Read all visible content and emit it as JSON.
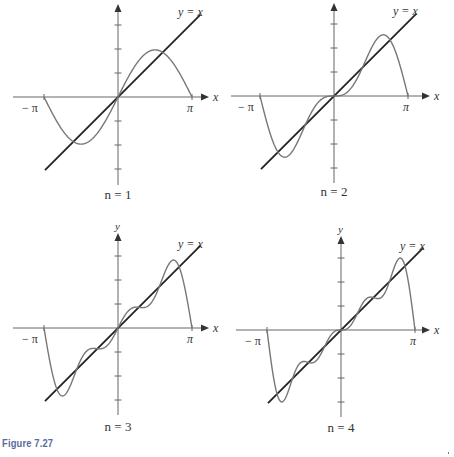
{
  "figure": {
    "caption": "Figure 7.27",
    "colors": {
      "axis": "#666666",
      "line": "#222222",
      "curve": "#777777",
      "text": "#333333"
    }
  },
  "chart_data": [
    {
      "type": "line",
      "title": "n = 1",
      "xlabel": "x",
      "ylabel": "y",
      "xlim": [
        -3.14159,
        3.14159
      ],
      "xticks": [
        "−π",
        "π"
      ],
      "yticks": [
        -3,
        -2,
        -1,
        1,
        2,
        3
      ],
      "series": [
        {
          "name": "y = x",
          "type": "function",
          "expr": "x",
          "x_range": [
            -3.14159,
            3.14159
          ]
        },
        {
          "name": "S_1(x) = 2 sin x",
          "type": "fourier_partial_sum",
          "n": 1,
          "x_range": [
            -3.14159,
            3.14159
          ]
        }
      ],
      "annotations": [
        "y = x"
      ]
    },
    {
      "type": "line",
      "title": "n = 2",
      "xlabel": "x",
      "ylabel": "y",
      "xlim": [
        -3.14159,
        3.14159
      ],
      "xticks": [
        "−π",
        "π"
      ],
      "yticks": [
        -3,
        -2,
        -1,
        1,
        2,
        3
      ],
      "series": [
        {
          "name": "y = x",
          "type": "function",
          "expr": "x",
          "x_range": [
            -3.14159,
            3.14159
          ]
        },
        {
          "name": "S_2(x) = 2 sin x − sin 2x",
          "type": "fourier_partial_sum",
          "n": 2,
          "x_range": [
            -3.14159,
            3.14159
          ]
        }
      ],
      "annotations": [
        "y = x"
      ]
    },
    {
      "type": "line",
      "title": "n = 3",
      "xlabel": "x",
      "ylabel": "y",
      "xlim": [
        -3.14159,
        3.14159
      ],
      "xticks": [
        "−π",
        "π"
      ],
      "yticks": [
        -3,
        -2,
        -1,
        1,
        2,
        3
      ],
      "series": [
        {
          "name": "y = x",
          "type": "function",
          "expr": "x",
          "x_range": [
            -3.14159,
            3.14159
          ]
        },
        {
          "name": "S_3(x) = 2 sin x − sin 2x + (2/3) sin 3x",
          "type": "fourier_partial_sum",
          "n": 3,
          "x_range": [
            -3.14159,
            3.14159
          ]
        }
      ],
      "annotations": [
        "y = x"
      ]
    },
    {
      "type": "line",
      "title": "n = 4",
      "xlabel": "x",
      "ylabel": "y",
      "xlim": [
        -3.14159,
        3.14159
      ],
      "xticks": [
        "−π",
        "π"
      ],
      "yticks": [
        -3,
        -2,
        -1,
        1,
        2,
        3
      ],
      "series": [
        {
          "name": "y = x",
          "type": "function",
          "expr": "x",
          "x_range": [
            -3.14159,
            3.14159
          ]
        },
        {
          "name": "S_4(x) = 2 sin x − sin 2x + (2/3) sin 3x − (1/2) sin 4x",
          "type": "fourier_partial_sum",
          "n": 4,
          "x_range": [
            -3.14159,
            3.14159
          ]
        }
      ],
      "annotations": [
        "y = x"
      ]
    }
  ],
  "panels": [
    {
      "label": "n = 1",
      "n": 1,
      "ox": 118,
      "oy": 97,
      "pi_px": 74,
      "unit_px": 24,
      "ytop": 4,
      "ybot": 185,
      "xleft": 13,
      "xright": 209,
      "label_y": 199,
      "ylabel_visible": false,
      "line_label_pos": [
        178,
        16
      ],
      "line_ext": [
        -3.1,
        3.5
      ]
    },
    {
      "label": "n = 2",
      "n": 2,
      "ox": 334,
      "oy": 96,
      "pi_px": 74,
      "unit_px": 24,
      "ytop": 3,
      "ybot": 183,
      "xleft": 231,
      "xright": 430,
      "label_y": 196,
      "ylabel_visible": false,
      "line_label_pos": [
        393,
        15
      ],
      "line_ext": [
        -3.1,
        3.5
      ]
    },
    {
      "label": "n = 3",
      "n": 3,
      "ox": 118,
      "oy": 328,
      "pi_px": 74,
      "unit_px": 24,
      "ytop": 233,
      "ybot": 415,
      "xleft": 13,
      "xright": 209,
      "label_y": 431,
      "ylabel_visible": true,
      "line_label_pos": [
        178,
        248
      ],
      "line_ext": [
        -3.1,
        3.5
      ]
    },
    {
      "label": "n = 4",
      "n": 4,
      "ox": 341,
      "oy": 330,
      "pi_px": 74,
      "unit_px": 24,
      "ytop": 236,
      "ybot": 417,
      "xleft": 236,
      "xright": 430,
      "label_y": 432,
      "ylabel_visible": true,
      "line_label_pos": [
        400,
        250
      ],
      "line_ext": [
        -3.1,
        3.5
      ]
    }
  ],
  "text": {
    "x_axis_label": "x",
    "y_axis_label": "y",
    "neg_pi": "− π",
    "pos_pi": "π",
    "line_label": "y = x"
  }
}
